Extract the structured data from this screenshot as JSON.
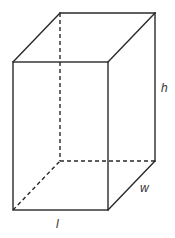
{
  "diagram": {
    "type": "rectangular-prism",
    "labels": {
      "length": "l",
      "width": "w",
      "height": "h"
    },
    "colors": {
      "stroke": "#2a2a2a",
      "label": "#333333",
      "background": "#ffffff"
    }
  }
}
